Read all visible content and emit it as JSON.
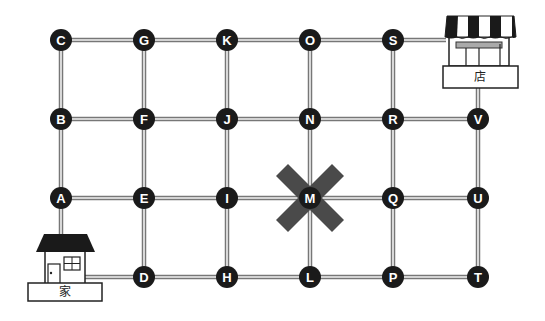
{
  "diagram": {
    "type": "grid-route-map",
    "colors": {
      "node": "#1a1a1a",
      "line_edge": "#777777",
      "line_core": "#f2f2f2",
      "blocked_x": "#4a4a4a"
    },
    "columns_x": [
      61,
      144,
      227,
      310,
      393,
      478
    ],
    "rows_y": [
      40,
      119,
      198,
      277
    ],
    "nodes": [
      {
        "id": "C",
        "col": 0,
        "row": 0
      },
      {
        "id": "G",
        "col": 1,
        "row": 0
      },
      {
        "id": "K",
        "col": 2,
        "row": 0
      },
      {
        "id": "O",
        "col": 3,
        "row": 0
      },
      {
        "id": "S",
        "col": 4,
        "row": 0
      },
      {
        "id": "B",
        "col": 0,
        "row": 1
      },
      {
        "id": "F",
        "col": 1,
        "row": 1
      },
      {
        "id": "J",
        "col": 2,
        "row": 1
      },
      {
        "id": "N",
        "col": 3,
        "row": 1
      },
      {
        "id": "R",
        "col": 4,
        "row": 1
      },
      {
        "id": "V",
        "col": 5,
        "row": 1
      },
      {
        "id": "A",
        "col": 0,
        "row": 2
      },
      {
        "id": "E",
        "col": 1,
        "row": 2
      },
      {
        "id": "I",
        "col": 2,
        "row": 2
      },
      {
        "id": "M",
        "col": 3,
        "row": 2
      },
      {
        "id": "Q",
        "col": 4,
        "row": 2
      },
      {
        "id": "U",
        "col": 5,
        "row": 2
      },
      {
        "id": "D",
        "col": 1,
        "row": 3
      },
      {
        "id": "H",
        "col": 2,
        "row": 3
      },
      {
        "id": "L",
        "col": 3,
        "row": 3
      },
      {
        "id": "P",
        "col": 4,
        "row": 3
      },
      {
        "id": "T",
        "col": 5,
        "row": 3
      }
    ],
    "blocked_node": "M",
    "home": {
      "label": "家"
    },
    "store": {
      "label": "店"
    }
  }
}
